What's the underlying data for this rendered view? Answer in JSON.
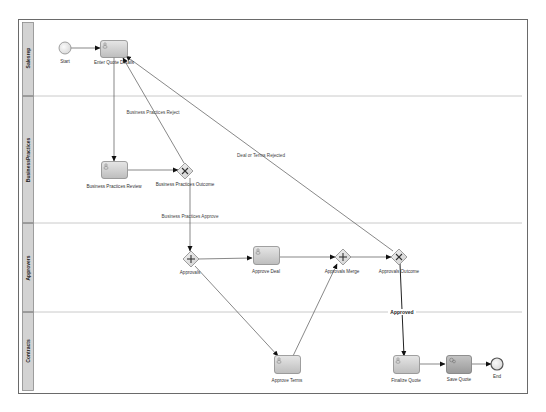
{
  "diagram": {
    "lanes": [
      {
        "id": "lane-salesrep",
        "label": "Salesrep"
      },
      {
        "id": "lane-businesspractices",
        "label": "BusinessPractices"
      },
      {
        "id": "lane-approvers",
        "label": "Approvers"
      },
      {
        "id": "lane-contracts",
        "label": "Contracts"
      }
    ],
    "nodes": [
      {
        "id": "start",
        "type": "start-event",
        "label": "Start",
        "lane": "Salesrep"
      },
      {
        "id": "enter-quote-details",
        "type": "user-task",
        "label": "Enter Quote Details",
        "lane": "Salesrep"
      },
      {
        "id": "business-practices-review",
        "type": "user-task",
        "label": "Business Practices Review",
        "lane": "BusinessPractices"
      },
      {
        "id": "business-practices-outcome",
        "type": "exclusive-gateway",
        "label": "Business Practices Outcome",
        "lane": "BusinessPractices"
      },
      {
        "id": "approvals",
        "type": "parallel-gateway",
        "label": "Approvals",
        "lane": "Approvers"
      },
      {
        "id": "approve-deal",
        "type": "user-task",
        "label": "Approve Deal",
        "lane": "Approvers"
      },
      {
        "id": "approvals-merge",
        "type": "parallel-gateway",
        "label": "Approvals Merge",
        "lane": "Approvers"
      },
      {
        "id": "approvals-outcome",
        "type": "exclusive-gateway",
        "label": "Approvals Outcome",
        "lane": "Approvers"
      },
      {
        "id": "approve-terms",
        "type": "user-task",
        "label": "Approve Terms",
        "lane": "Contracts"
      },
      {
        "id": "finalize-quote",
        "type": "user-task",
        "label": "Finalize Quote",
        "lane": "Contracts"
      },
      {
        "id": "save-quote",
        "type": "service-task",
        "label": "Save Quote",
        "lane": "Contracts"
      },
      {
        "id": "end",
        "type": "end-event",
        "label": "End",
        "lane": "Contracts"
      }
    ],
    "edges": [
      {
        "from": "start",
        "to": "enter-quote-details",
        "label": ""
      },
      {
        "from": "enter-quote-details",
        "to": "business-practices-review",
        "label": ""
      },
      {
        "from": "business-practices-review",
        "to": "business-practices-outcome",
        "label": ""
      },
      {
        "from": "business-practices-outcome",
        "to": "enter-quote-details",
        "label": "Business Practices Reject"
      },
      {
        "from": "business-practices-outcome",
        "to": "approvals",
        "label": "Business Practices Approve"
      },
      {
        "from": "approvals",
        "to": "approve-deal",
        "label": ""
      },
      {
        "from": "approvals",
        "to": "approve-terms",
        "label": ""
      },
      {
        "from": "approve-deal",
        "to": "approvals-merge",
        "label": ""
      },
      {
        "from": "approve-terms",
        "to": "approvals-merge",
        "label": ""
      },
      {
        "from": "approvals-merge",
        "to": "approvals-outcome",
        "label": ""
      },
      {
        "from": "approvals-outcome",
        "to": "enter-quote-details",
        "label": "Deal or Terms Rejected"
      },
      {
        "from": "approvals-outcome",
        "to": "finalize-quote",
        "label": "Approved"
      },
      {
        "from": "finalize-quote",
        "to": "save-quote",
        "label": ""
      },
      {
        "from": "save-quote",
        "to": "end",
        "label": ""
      }
    ]
  }
}
